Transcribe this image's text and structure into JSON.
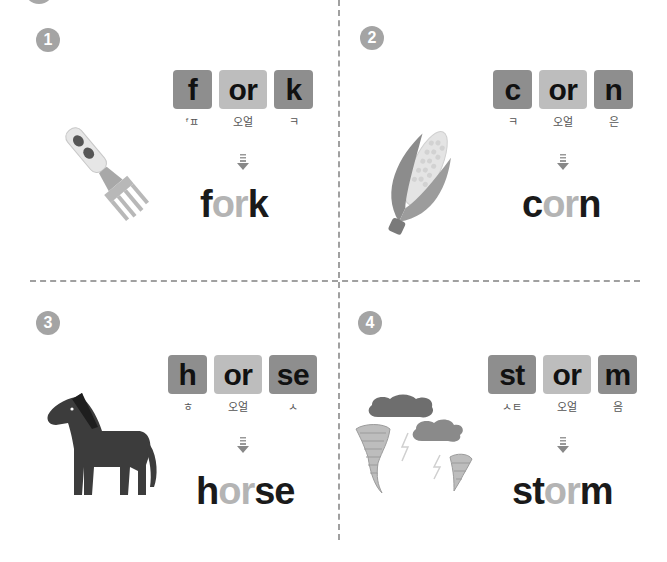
{
  "page": {
    "layout": "2x2 phonics worksheet",
    "colors": {
      "consonant_tile": "#8e8e8e",
      "vowel_tile": "#bdbdbd",
      "badge": "#a4a4a4",
      "divider": "#a0a0a0",
      "word_dark": "#1a1a1a",
      "word_light": "#b4b4b4"
    }
  },
  "items": [
    {
      "number": "1",
      "illustration": "fork-icon",
      "tiles": [
        {
          "text": "f",
          "type": "cons"
        },
        {
          "text": "or",
          "type": "vowel"
        },
        {
          "text": "k",
          "type": "cons"
        }
      ],
      "hints": [
        "ᶠㅍ",
        "오얼",
        "ㅋ"
      ],
      "word_parts": [
        {
          "text": "f",
          "tone": "dark"
        },
        {
          "text": "or",
          "tone": "light"
        },
        {
          "text": "k",
          "tone": "dark"
        }
      ],
      "word": "fork"
    },
    {
      "number": "2",
      "illustration": "corn-icon",
      "tiles": [
        {
          "text": "c",
          "type": "cons"
        },
        {
          "text": "or",
          "type": "vowel"
        },
        {
          "text": "n",
          "type": "cons"
        }
      ],
      "hints": [
        "ㅋ",
        "오얼",
        "은"
      ],
      "word_parts": [
        {
          "text": "c",
          "tone": "dark"
        },
        {
          "text": "or",
          "tone": "light"
        },
        {
          "text": "n",
          "tone": "dark"
        }
      ],
      "word": "corn"
    },
    {
      "number": "3",
      "illustration": "horse-icon",
      "tiles": [
        {
          "text": "h",
          "type": "cons"
        },
        {
          "text": "or",
          "type": "vowel"
        },
        {
          "text": "se",
          "type": "cons"
        }
      ],
      "hints": [
        "ㅎ",
        "오얼",
        "ㅅ"
      ],
      "word_parts": [
        {
          "text": "h",
          "tone": "dark"
        },
        {
          "text": "or",
          "tone": "light"
        },
        {
          "text": "se",
          "tone": "dark"
        }
      ],
      "word": "horse"
    },
    {
      "number": "4",
      "illustration": "storm-icon",
      "tiles": [
        {
          "text": "st",
          "type": "cons"
        },
        {
          "text": "or",
          "type": "vowel"
        },
        {
          "text": "m",
          "type": "cons"
        }
      ],
      "hints": [
        "ㅅㅌ",
        "오얼",
        "음"
      ],
      "word_parts": [
        {
          "text": "st",
          "tone": "dark"
        },
        {
          "text": "or",
          "tone": "light"
        },
        {
          "text": "m",
          "tone": "dark"
        }
      ],
      "word": "storm"
    }
  ]
}
